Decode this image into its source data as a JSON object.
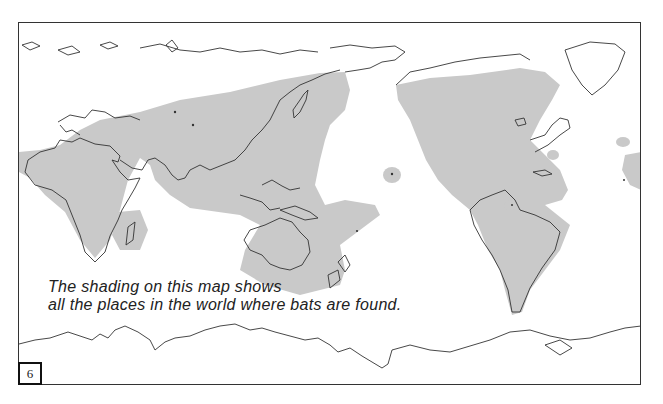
{
  "map": {
    "title": "World distribution of bats",
    "shading_color": "#c9c9c9",
    "outline_color": "#333333",
    "caption": {
      "line1": "The shading on this map shows",
      "line2": "all the places in the world where bats are found."
    },
    "page_number": "6"
  }
}
